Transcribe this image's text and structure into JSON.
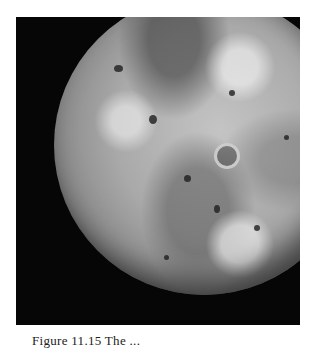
{
  "figure": {
    "image_description": "Grayscale spacecraft photograph of Jupiter's moon Io against black space",
    "colors": {
      "background": "#ffffff",
      "space": "#060606",
      "surface_light": "#c4c4c4",
      "surface_dark": "#4a4a4a"
    }
  },
  "caption": {
    "text": "Figure 11.15 The ..."
  }
}
